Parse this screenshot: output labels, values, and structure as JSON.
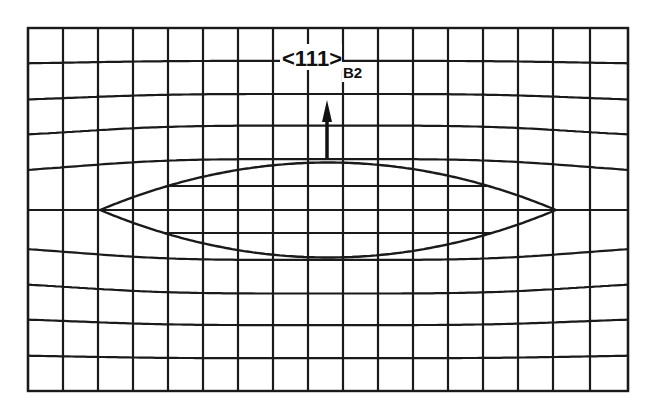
{
  "figure": {
    "type": "distorted-lattice-diagram",
    "label_main": "<111>",
    "label_subscript": "B2",
    "arrow_direction": "up",
    "colors": {
      "line": "#1a1a1a",
      "background": "#ffffff"
    }
  },
  "grid": {
    "left": 28,
    "right": 628,
    "top": 28,
    "bottom": 391,
    "vertical_x": [
      28,
      63,
      98,
      133,
      168,
      203,
      238,
      273,
      308,
      343,
      378,
      413,
      448,
      483,
      518,
      553,
      590,
      628
    ],
    "horizontal_y": [
      28,
      64,
      101,
      137,
      173,
      210,
      246,
      282,
      318,
      355,
      391
    ]
  },
  "ellipse": {
    "left_tip": [
      100,
      210
    ],
    "right_tip": [
      556,
      210
    ],
    "top_y": 162,
    "bottom_y": 257,
    "inner_lines_y": [
      186,
      210,
      233
    ]
  },
  "arrow": {
    "x": 327,
    "y_start": 158,
    "y_end": 100
  }
}
